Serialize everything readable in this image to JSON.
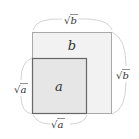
{
  "diagram": {
    "big_square": {
      "label": "b",
      "fill": "#f2f2f2",
      "stroke": "#a8a8a8"
    },
    "small_square": {
      "label": "a",
      "fill": "#e6e6e6",
      "stroke": "#666666"
    },
    "dimensions": {
      "top": {
        "radical": "√",
        "var": "b"
      },
      "right": {
        "radical": "√",
        "var": "b"
      },
      "left": {
        "radical": "√",
        "var": "a"
      },
      "bottom": {
        "radical": "√",
        "var": "a"
      }
    },
    "brace_color": "#c8c8c8"
  }
}
